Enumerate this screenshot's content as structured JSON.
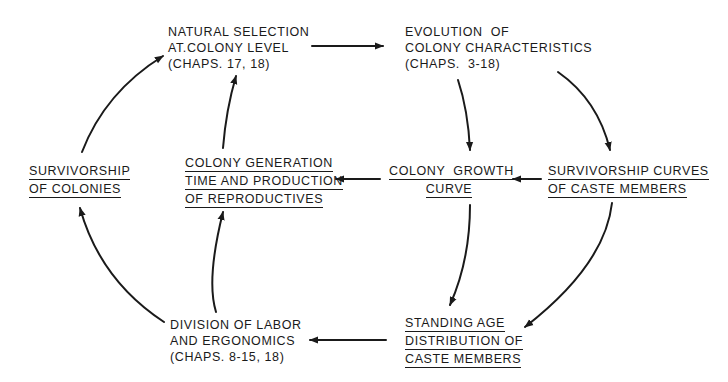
{
  "diagram": {
    "type": "flow-cycle",
    "background": "#ffffff",
    "ink_color": "#1a1a1a",
    "nodes": {
      "natural_selection": {
        "lines": [
          "NATURAL SELECTION",
          "AT.COLONY LEVEL",
          "(CHAPS. 17, 18)"
        ],
        "underlined": false
      },
      "evolution": {
        "lines": [
          "EVOLUTION  OF",
          "COLONY CHARACTERISTICS",
          "(CHAPS.  3-18)"
        ],
        "underlined": false
      },
      "survivorship_colonies": {
        "lines": [
          "SURVIVORSHIP",
          "OF COLONIES"
        ],
        "underlined": true
      },
      "colony_generation": {
        "lines": [
          "COLONY GENERATION",
          "TIME AND PRODUCTION",
          "OF REPRODUCTIVES"
        ],
        "underlined": true
      },
      "colony_growth": {
        "lines": [
          "COLONY  GROWTH",
          "CURVE"
        ],
        "underlined": true
      },
      "survivorship_curves": {
        "lines": [
          "SURVIVORSHIP CURVES",
          "OF CASTE MEMBERS"
        ],
        "underlined": true
      },
      "division_of_labor": {
        "lines": [
          "DIVISION OF LABOR",
          "AND ERGONOMICS",
          "(CHAPS. 8-15, 18)"
        ],
        "underlined": false
      },
      "standing_age": {
        "lines": [
          "STANDING AGE",
          "DISTRIBUTION OF",
          "CASTE MEMBERS"
        ],
        "underlined": true
      }
    },
    "edges": [
      {
        "from": "Natural Selection at Colony Level",
        "to": "Evolution of Colony Characteristics"
      },
      {
        "from": "Evolution of Colony Characteristics",
        "to": "Colony Growth Curve"
      },
      {
        "from": "Evolution of Colony Characteristics",
        "to": "Survivorship Curves of Caste Members"
      },
      {
        "from": "Survivorship Curves of Caste Members",
        "to": "Colony Growth Curve"
      },
      {
        "from": "Colony Growth Curve",
        "to": "Colony Generation Time and Production of Reproductives"
      },
      {
        "from": "Colony Generation Time and Production of Reproductives",
        "to": "Natural Selection at Colony Level"
      },
      {
        "from": "Survivorship of Colonies",
        "to": "Natural Selection at Colony Level"
      },
      {
        "from": "Colony Growth Curve",
        "to": "Standing Age Distribution of Caste Members"
      },
      {
        "from": "Survivorship Curves of Caste Members",
        "to": "Standing Age Distribution of Caste Members"
      },
      {
        "from": "Standing Age Distribution of Caste Members",
        "to": "Division of Labor and Ergonomics"
      },
      {
        "from": "Division of Labor and Ergonomics",
        "to": "Colony Generation Time and Production of Reproductives"
      },
      {
        "from": "Division of Labor and Ergonomics",
        "to": "Survivorship of Colonies"
      }
    ]
  }
}
